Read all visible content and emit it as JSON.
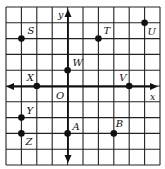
{
  "diagram": {
    "type": "coordinate-grid",
    "grid": {
      "columns": 10,
      "rows": 10,
      "x_range": [
        -4,
        6
      ],
      "y_range": [
        -5,
        5
      ]
    },
    "axes": {
      "x_label": "x",
      "y_label": "y",
      "origin_label": "O"
    },
    "points": [
      {
        "label": "S",
        "x": -3,
        "y": 3
      },
      {
        "label": "T",
        "x": 2,
        "y": 3
      },
      {
        "label": "U",
        "x": 5,
        "y": 4
      },
      {
        "label": "W",
        "x": 0,
        "y": 1
      },
      {
        "label": "X",
        "x": -2,
        "y": 0
      },
      {
        "label": "V",
        "x": 4,
        "y": 0
      },
      {
        "label": "Y",
        "x": -3,
        "y": -2
      },
      {
        "label": "Z",
        "x": -3,
        "y": -3
      },
      {
        "label": "A",
        "x": 0,
        "y": -3
      },
      {
        "label": "B",
        "x": 3,
        "y": -3
      }
    ]
  }
}
